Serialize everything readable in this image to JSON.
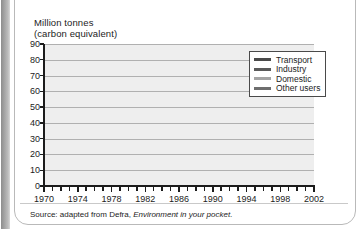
{
  "figure": {
    "axis_title": "Million tonnes\n(carbon equivalent)",
    "source": "Source: adapted from Defra, ",
    "source_italic": "Environment in your pocket",
    "source_end": "."
  },
  "legend": {
    "position": "top-right",
    "items": [
      {
        "label": "Transport",
        "color": "#4a4a4a"
      },
      {
        "label": "Industry",
        "color": "#5a5a5a"
      },
      {
        "label": "Domestic",
        "color": "#a5a5a5"
      },
      {
        "label": "Other users",
        "color": "#6e6e6e"
      }
    ]
  },
  "chart_data": {
    "type": "line",
    "title": "",
    "xlabel": "",
    "ylabel": "Million tonnes (carbon equivalent)",
    "xlim": [
      1970,
      2002
    ],
    "ylim": [
      0,
      90
    ],
    "ytick_values": [
      0,
      10,
      20,
      30,
      40,
      50,
      60,
      70,
      80,
      90
    ],
    "xtick_labels": [
      "1970",
      "1974",
      "1978",
      "1982",
      "1986",
      "1990",
      "1994",
      "1998",
      "2002"
    ],
    "xtick_label_values": [
      1970,
      1974,
      1978,
      1982,
      1986,
      1990,
      1994,
      1998,
      2002
    ],
    "x": [
      1970,
      1971,
      1972,
      1973,
      1974,
      1975,
      1976,
      1977,
      1978,
      1979,
      1980,
      1981,
      1982,
      1983,
      1984,
      1985,
      1986,
      1987,
      1988,
      1989,
      1990,
      1991,
      1992,
      1993,
      1994,
      1995,
      1996,
      1997,
      1998,
      1999,
      2000,
      2001,
      2002
    ],
    "grid": true,
    "series": [
      {
        "name": "Industry",
        "color": "#5a5a5a",
        "values": [
          82,
          78,
          76,
          77,
          81,
          75,
          68,
          71,
          70,
          73,
          65,
          58,
          55,
          53,
          52,
          51,
          50,
          49,
          50,
          50,
          50,
          48,
          47,
          45,
          45,
          44,
          44,
          42,
          42,
          41,
          41,
          40,
          41
        ]
      },
      {
        "name": "Domestic",
        "color": "#a5a5a5",
        "values": [
          54,
          51,
          50,
          50,
          48,
          45,
          44,
          46,
          46,
          48,
          49,
          47,
          45,
          43,
          40,
          42,
          45,
          45,
          43,
          41,
          41,
          42,
          43,
          42,
          41,
          37,
          42,
          38,
          39,
          40,
          41,
          42,
          40
        ]
      },
      {
        "name": "Other users",
        "color": "#6e6e6e",
        "values": [
          29,
          27,
          26,
          27,
          25,
          24,
          25,
          27,
          29,
          31,
          29,
          28,
          27,
          27,
          27,
          28,
          28,
          28,
          28,
          27,
          27,
          27,
          26,
          25,
          25,
          24,
          24,
          23,
          23,
          23,
          24,
          23,
          22
        ]
      },
      {
        "name": "Transport",
        "color": "#4a4a4a",
        "values": [
          23,
          23,
          24,
          26,
          25,
          25,
          26,
          28,
          30,
          31,
          28,
          29,
          30,
          31,
          33,
          34,
          36,
          37,
          38,
          39,
          40,
          40,
          41,
          41,
          42,
          43,
          44,
          43,
          43,
          42,
          42,
          42,
          42
        ]
      }
    ]
  }
}
